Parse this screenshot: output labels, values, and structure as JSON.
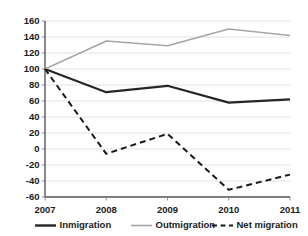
{
  "chart_data": {
    "type": "line",
    "title": "",
    "xlabel": "",
    "ylabel": "",
    "categories": [
      "2007",
      "2008",
      "2009",
      "2010",
      "2011"
    ],
    "x": [
      2007,
      2008,
      2009,
      2010,
      2011
    ],
    "ylim": [
      -60,
      160
    ],
    "ytick_step": 20,
    "yticks": [
      160,
      140,
      120,
      100,
      80,
      60,
      40,
      20,
      0,
      -20,
      -40,
      -60
    ],
    "ytick_labels": [
      "160",
      "140",
      "120",
      "100",
      "80",
      "60",
      "40",
      "20",
      "0",
      "-20",
      "-40",
      "-60"
    ],
    "grid": true,
    "grid_axis": "y",
    "legend_position": "bottom",
    "series": [
      {
        "name": "Inmigration",
        "style": "solid",
        "color": "#262626",
        "values": [
          100,
          71,
          79,
          58,
          62
        ]
      },
      {
        "name": "Outmigration",
        "style": "solid",
        "color": "#a6a6a6",
        "values": [
          100,
          135,
          129,
          150,
          142
        ]
      },
      {
        "name": "Net migration",
        "style": "dashed",
        "color": "#1a1a1a",
        "values": [
          100,
          -6,
          19,
          -51,
          -32
        ]
      }
    ]
  },
  "legend": {
    "items": [
      {
        "label": "Inmigration"
      },
      {
        "label": "Outmigration"
      },
      {
        "label": "Net migration"
      }
    ]
  },
  "colors": {
    "inmigration": "#262626",
    "outmigration": "#a6a6a6",
    "net_migration": "#1a1a1a",
    "gridline": "#d9d9d9",
    "axis": "#595959",
    "background": "#ffffff"
  }
}
